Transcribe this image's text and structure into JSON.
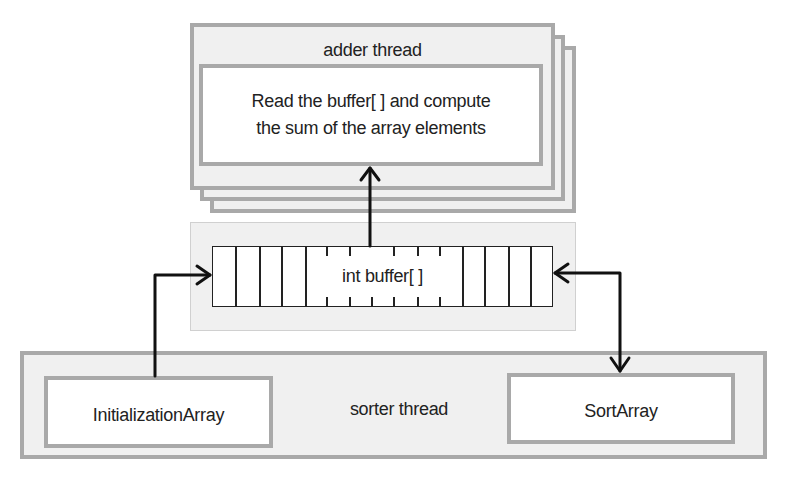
{
  "diagram": {
    "adder_thread": {
      "title": "adder thread",
      "task_line1": "Read the buffer[ ] and compute",
      "task_line2": "the sum of the array elements",
      "stack_count": 3
    },
    "buffer": {
      "label": "int buffer[ ]"
    },
    "sorter_thread": {
      "title": "sorter thread",
      "initialization": "InitializationArray",
      "sort": "SortArray"
    },
    "arrows": [
      {
        "from": "buffer",
        "to": "adder_thread",
        "direction": "up"
      },
      {
        "from": "InitializationArray",
        "to": "buffer",
        "direction": "right"
      },
      {
        "from": "buffer",
        "to": "SortArray",
        "direction": "bidirectional"
      }
    ],
    "colors": {
      "frame_border": "#a9a9a9",
      "frame_fill": "#f0f0f0",
      "inner_fill": "#ffffff",
      "arrow": "#111111"
    }
  }
}
